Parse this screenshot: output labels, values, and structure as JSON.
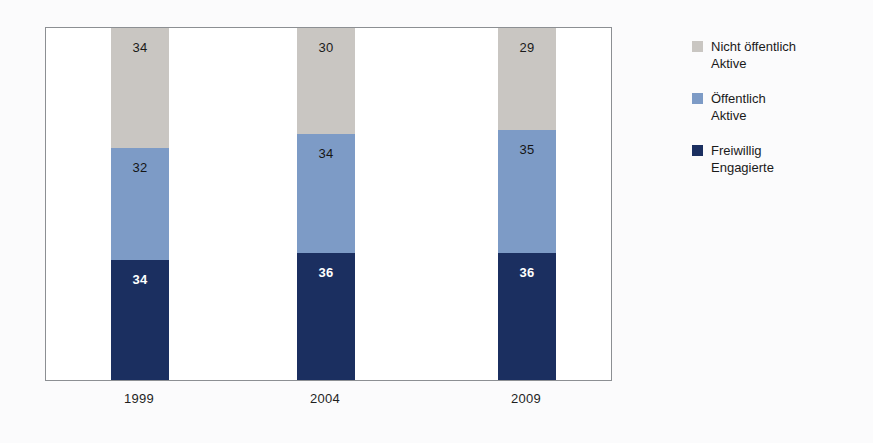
{
  "chart_data": {
    "type": "bar",
    "subtype": "stacked-column-100-percent",
    "title": "",
    "subtitle": "",
    "xlabel": "",
    "ylabel": "",
    "categories": [
      "1999",
      "2004",
      "2009"
    ],
    "ylim": [
      0,
      100
    ],
    "grid": false,
    "legend_position": "right",
    "stack_order_bottom_to_top": [
      "Freiwillig Engagierte",
      "Öffentlich Aktive",
      "Nicht öffentlich Aktive"
    ],
    "series": [
      {
        "name": "Nicht öffentlich Aktive",
        "color": "#c9c6c2",
        "values": [
          34,
          30,
          29
        ]
      },
      {
        "name": "Öffentlich Aktive",
        "color": "#7d9bc6",
        "values": [
          32,
          34,
          35
        ]
      },
      {
        "name": "Freiwillig Engagierte",
        "color": "#1b2f60",
        "values": [
          34,
          36,
          36
        ]
      }
    ]
  },
  "legend": {
    "items": [
      {
        "label_line1": "Nicht öffentlich",
        "label_line2": "Aktive",
        "color": "#c9c6c2"
      },
      {
        "label_line1": "Öffentlich",
        "label_line2": "Aktive",
        "color": "#7d9bc6"
      },
      {
        "label_line1": "Freiwillig",
        "label_line2": "Engagierte",
        "color": "#1b2f60"
      }
    ]
  },
  "bars": [
    {
      "category": "1999",
      "segments": [
        {
          "series": "Nicht öffentlich Aktive",
          "value": "34"
        },
        {
          "series": "Öffentlich Aktive",
          "value": "32"
        },
        {
          "series": "Freiwillig Engagierte",
          "value": "34"
        }
      ]
    },
    {
      "category": "2004",
      "segments": [
        {
          "series": "Nicht öffentlich Aktive",
          "value": "30"
        },
        {
          "series": "Öffentlich Aktive",
          "value": "34"
        },
        {
          "series": "Freiwillig Engagierte",
          "value": "36"
        }
      ]
    },
    {
      "category": "2009",
      "segments": [
        {
          "series": "Nicht öffentlich Aktive",
          "value": "29"
        },
        {
          "series": "Öffentlich Aktive",
          "value": "35"
        },
        {
          "series": "Freiwillig Engagierte",
          "value": "36"
        }
      ]
    }
  ],
  "axis": {
    "categories": [
      "1999",
      "2004",
      "2009"
    ]
  }
}
